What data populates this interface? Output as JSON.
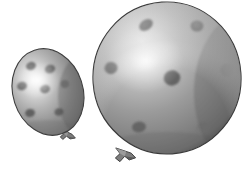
{
  "scene": {
    "title": "Two polka-dot balloons",
    "width": 252,
    "height": 172,
    "background_color": "#ffffff",
    "style": "grayscale halftone photograph, two inflated latex balloons with darker round spots"
  },
  "palette": {
    "background": "#ffffff",
    "balloon_light": "#f2f2f2",
    "balloon_mid": "#9a9a9a",
    "balloon_shadow": "#6f6f6f",
    "balloon_edge": "#4e4e4e",
    "dot_color": "#6a6a6a",
    "dot_dark": "#5a5a5a",
    "knot_color": "#7d7d7d",
    "knot_dark": "#4a4a4a",
    "outline": "#3c3c3c"
  },
  "objects": [
    {
      "name": "small-balloon",
      "label": "Small polka-dot balloon",
      "shape": "ellipse",
      "center_x": 48,
      "center_y": 92,
      "radius_x": 35,
      "radius_y": 44,
      "rotation_deg": -18,
      "highlight_x": 38,
      "highlight_y": 80,
      "highlight_radius": 20,
      "dot_count": 7,
      "dots": [
        {
          "cx": 31,
          "cy": 66,
          "rx": 5.0,
          "ry": 4.0,
          "rot": -20
        },
        {
          "cx": 50,
          "cy": 69,
          "rx": 5.2,
          "ry": 4.2,
          "rot": -20
        },
        {
          "cx": 22,
          "cy": 86,
          "rx": 5.0,
          "ry": 4.2,
          "rot": -15
        },
        {
          "cx": 45,
          "cy": 89,
          "rx": 5.0,
          "ry": 4.2,
          "rot": -15
        },
        {
          "cx": 65,
          "cy": 84,
          "rx": 4.2,
          "ry": 4.0,
          "rot": -10
        },
        {
          "cx": 30,
          "cy": 113,
          "rx": 5.0,
          "ry": 4.0,
          "rot": -10
        },
        {
          "cx": 59,
          "cy": 112,
          "rx": 4.6,
          "ry": 3.8,
          "rot": -10
        }
      ],
      "knot": {
        "name": "small-balloon-knot",
        "x": 66,
        "y": 134,
        "width": 18,
        "height": 13,
        "rotation_deg": 12
      }
    },
    {
      "name": "large-balloon",
      "label": "Large polka-dot balloon",
      "shape": "ellipse",
      "center_x": 167,
      "center_y": 78,
      "radius_x": 74,
      "radius_y": 76,
      "rotation_deg": -4,
      "highlight_x": 145,
      "highlight_y": 60,
      "highlight_radius": 34,
      "dot_count": 7,
      "dots": [
        {
          "cx": 146,
          "cy": 25,
          "rx": 7.5,
          "ry": 5.2,
          "rot": -35
        },
        {
          "cx": 197,
          "cy": 26,
          "rx": 6.4,
          "ry": 5.6,
          "rot": 0
        },
        {
          "cx": 111,
          "cy": 68,
          "rx": 6.6,
          "ry": 6.0,
          "rot": -10
        },
        {
          "cx": 172,
          "cy": 78,
          "rx": 8.4,
          "ry": 7.6,
          "rot": -10
        },
        {
          "cx": 227,
          "cy": 70,
          "rx": 6.6,
          "ry": 6.4,
          "rot": 0
        },
        {
          "cx": 139,
          "cy": 127,
          "rx": 7.0,
          "ry": 5.4,
          "rot": -10
        },
        {
          "cx": 203,
          "cy": 128,
          "rx": 7.4,
          "ry": 5.6,
          "rot": -15
        }
      ],
      "knot": {
        "name": "large-balloon-knot",
        "x": 122,
        "y": 153,
        "width": 23,
        "height": 14,
        "rotation_deg": 8
      }
    }
  ]
}
